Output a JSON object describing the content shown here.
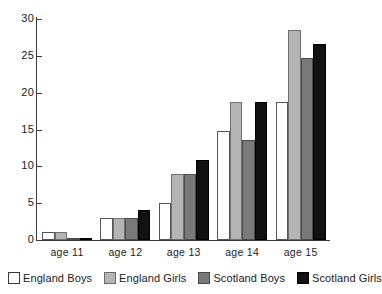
{
  "chart_data": {
    "type": "bar",
    "title": "",
    "subtitle": "",
    "xlabel": "",
    "ylabel": "",
    "categories": [
      "age 11",
      "age 12",
      "age 13",
      "age 14",
      "age 15"
    ],
    "series": [
      {
        "name": "England Boys",
        "color": "#ffffff",
        "values": [
          1.1,
          3.0,
          5.0,
          14.8,
          18.7
        ]
      },
      {
        "name": "England Girls",
        "color": "#b4b4b4",
        "values": [
          1.1,
          3.0,
          8.9,
          18.8,
          28.5
        ]
      },
      {
        "name": "Scotland Boys",
        "color": "#7a7a7a",
        "values": [
          0.2,
          3.0,
          8.9,
          13.6,
          24.7
        ]
      },
      {
        "name": "Scotland Girls",
        "color": "#111111",
        "values": [
          0.2,
          4.1,
          10.8,
          18.7,
          26.6
        ]
      }
    ],
    "ylim": [
      0,
      30
    ],
    "yticks": [
      0,
      5,
      10,
      15,
      20,
      25,
      30
    ],
    "ytick_labels": [
      "0",
      "5",
      "10",
      "15",
      "20",
      "25",
      "30"
    ],
    "grid": false,
    "legend_position": "bottom",
    "legend_entries": [
      "England Boys",
      "England Girls",
      "Scotland Boys",
      "Scotland Girls"
    ]
  }
}
